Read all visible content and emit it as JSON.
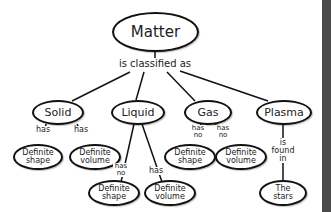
{
  "diagram": {
    "type": "concept-map",
    "root": {
      "label": "Matter"
    },
    "root_link": "is classified as",
    "categories": [
      {
        "label": "Solid",
        "children": [
          {
            "link": "has",
            "label_line1": "Definite",
            "label_line2": "shape"
          },
          {
            "link": "has",
            "label_line1": "Definite",
            "label_line2": "volume"
          }
        ]
      },
      {
        "label": "Liquid",
        "children": [
          {
            "link_line1": "has",
            "link_line2": "no",
            "label_line1": "Definite",
            "label_line2": "shape"
          },
          {
            "link": "has",
            "label_line1": "Definite",
            "label_line2": "volume"
          }
        ]
      },
      {
        "label": "Gas",
        "children": [
          {
            "link_line1": "has",
            "link_line2": "no",
            "label_line1": "Definite",
            "label_line2": "shape"
          },
          {
            "link_line1": "has",
            "link_line2": "no",
            "label_line1": "Definite",
            "label_line2": "volume"
          }
        ]
      },
      {
        "label": "Plasma",
        "children": [
          {
            "link_line1": "is",
            "link_line2": "found",
            "link_line3": "in",
            "label_line1": "The",
            "label_line2": "stars"
          }
        ]
      }
    ]
  },
  "colors": {
    "line": "#111111",
    "text": "#222222",
    "background": "#ffffff",
    "edge_bar": "#4a4a4a"
  }
}
